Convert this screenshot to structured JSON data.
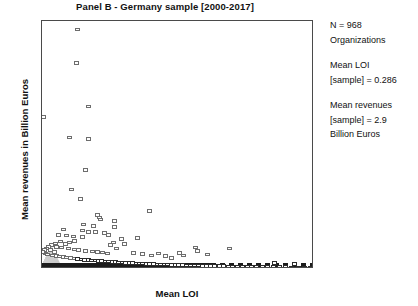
{
  "chart_data": {
    "type": "scatter",
    "title": "Panel B - Germany sample [2000-2017]",
    "xlabel": "Mean LOI",
    "ylabel": "Mean revenues in Billion Euros",
    "xlim": [
      0.0,
      1.0
    ],
    "ylim": [
      0,
      145
    ],
    "xticks": [
      "0.0",
      "0.1",
      "0.2",
      "0.3",
      "0.4",
      "0.5",
      "0.6",
      "0.7",
      "0.8",
      "0.9",
      "1.0"
    ],
    "xtick_values": [
      0.0,
      0.1,
      0.2,
      0.3,
      0.4,
      0.5,
      0.6,
      0.7,
      0.8,
      0.9,
      1.0
    ],
    "yticks": [
      "0",
      "20",
      "40",
      "60",
      "80",
      "100",
      "120",
      "140"
    ],
    "ytick_values": [
      0,
      20,
      40,
      60,
      80,
      100,
      120,
      140
    ],
    "grid": false,
    "legend": null,
    "marker": "open-square",
    "marker_color": "#6d6d6d",
    "points": [
      [
        0.13,
        140.0
      ],
      [
        0.128,
        120.5
      ],
      [
        0.172,
        95.0
      ],
      [
        0.005,
        89.0
      ],
      [
        0.1,
        77.0
      ],
      [
        0.172,
        76.0
      ],
      [
        0.16,
        58.0
      ],
      [
        0.108,
        46.5
      ],
      [
        0.395,
        34.0
      ],
      [
        0.14,
        41.0
      ],
      [
        0.205,
        31.5
      ],
      [
        0.21,
        30.0
      ],
      [
        0.215,
        29.0
      ],
      [
        0.268,
        28.0
      ],
      [
        0.265,
        24.5
      ],
      [
        0.08,
        23.0
      ],
      [
        0.15,
        22.5
      ],
      [
        0.195,
        21.5
      ],
      [
        0.06,
        20.0
      ],
      [
        0.09,
        19.5
      ],
      [
        0.115,
        19.0
      ],
      [
        0.15,
        18.8
      ],
      [
        0.35,
        18.0
      ],
      [
        0.172,
        21.5
      ],
      [
        0.228,
        21.0
      ],
      [
        0.25,
        14.0
      ],
      [
        0.262,
        15.5
      ],
      [
        0.275,
        12.0
      ],
      [
        0.055,
        13.0
      ],
      [
        0.07,
        12.5
      ],
      [
        0.098,
        12.0
      ],
      [
        0.12,
        11.5
      ],
      [
        0.135,
        11.0
      ],
      [
        0.16,
        10.5
      ],
      [
        0.185,
        10.2
      ],
      [
        0.205,
        10.0
      ],
      [
        0.222,
        9.6
      ],
      [
        0.24,
        9.2
      ],
      [
        0.03,
        11.0
      ],
      [
        0.045,
        10.0
      ],
      [
        0.012,
        9.0
      ],
      [
        0.022,
        8.5
      ],
      [
        0.038,
        8.0
      ],
      [
        0.052,
        7.6
      ],
      [
        0.065,
        7.2
      ],
      [
        0.078,
        6.9
      ],
      [
        0.09,
        6.6
      ],
      [
        0.105,
        6.3
      ],
      [
        0.118,
        6.0
      ],
      [
        0.132,
        5.8
      ],
      [
        0.146,
        5.6
      ],
      [
        0.158,
        5.4
      ],
      [
        0.17,
        5.2
      ],
      [
        0.182,
        5.0
      ],
      [
        0.195,
        4.9
      ],
      [
        0.208,
        4.7
      ],
      [
        0.22,
        4.6
      ],
      [
        0.232,
        4.4
      ],
      [
        0.245,
        4.3
      ],
      [
        0.258,
        4.1
      ],
      [
        0.27,
        4.0
      ],
      [
        0.282,
        3.9
      ],
      [
        0.295,
        3.8
      ],
      [
        0.308,
        3.6
      ],
      [
        0.32,
        3.5
      ],
      [
        0.333,
        3.4
      ],
      [
        0.346,
        3.3
      ],
      [
        0.358,
        3.2
      ],
      [
        0.37,
        3.1
      ],
      [
        0.384,
        3.0
      ],
      [
        0.396,
        2.9
      ],
      [
        0.41,
        2.8
      ],
      [
        0.424,
        2.7
      ],
      [
        0.437,
        2.6
      ],
      [
        0.45,
        2.6
      ],
      [
        0.463,
        2.5
      ],
      [
        0.476,
        2.4
      ],
      [
        0.49,
        2.3
      ],
      [
        0.503,
        2.3
      ],
      [
        0.516,
        2.2
      ],
      [
        0.53,
        2.1
      ],
      [
        0.545,
        2.1
      ],
      [
        0.56,
        2.0
      ],
      [
        0.575,
        2.0
      ],
      [
        0.59,
        1.9
      ],
      [
        0.605,
        1.9
      ],
      [
        0.62,
        1.8
      ],
      [
        0.636,
        1.8
      ],
      [
        0.652,
        1.7
      ],
      [
        0.668,
        1.7
      ],
      [
        0.684,
        1.6
      ],
      [
        0.7,
        1.6
      ],
      [
        0.718,
        1.5
      ],
      [
        0.736,
        1.5
      ],
      [
        0.754,
        1.4
      ],
      [
        0.772,
        1.4
      ],
      [
        0.79,
        1.3
      ],
      [
        0.81,
        1.3
      ],
      [
        0.83,
        1.2
      ],
      [
        0.85,
        1.2
      ],
      [
        0.872,
        1.1
      ],
      [
        0.895,
        1.1
      ],
      [
        0.918,
        1.0
      ],
      [
        0.942,
        1.0
      ],
      [
        0.966,
        0.9
      ],
      [
        0.988,
        0.9
      ],
      [
        0.505,
        9.5
      ],
      [
        0.52,
        8.0
      ],
      [
        0.565,
        12.5
      ],
      [
        0.572,
        10.5
      ],
      [
        0.61,
        8.5
      ],
      [
        0.69,
        12.0
      ],
      [
        0.455,
        7.5
      ],
      [
        0.43,
        9.0
      ],
      [
        0.475,
        6.5
      ],
      [
        0.855,
        3.5
      ],
      [
        0.93,
        2.8
      ],
      [
        0.152,
        26.0
      ],
      [
        0.188,
        25.0
      ],
      [
        0.245,
        20.0
      ],
      [
        0.292,
        17.5
      ],
      [
        0.305,
        14.5
      ],
      [
        0.338,
        9.5
      ],
      [
        0.368,
        8.8
      ],
      [
        0.402,
        7.8
      ],
      [
        0.118,
        16.5
      ],
      [
        0.102,
        15.5
      ],
      [
        0.085,
        14.5
      ],
      [
        0.068,
        16.0
      ],
      [
        0.048,
        15.0
      ],
      [
        0.035,
        14.0
      ],
      [
        0.025,
        13.0
      ],
      [
        0.015,
        12.0
      ],
      [
        0.008,
        11.0
      ],
      [
        0.002,
        10.0
      ]
    ]
  },
  "annotations": {
    "block_n": {
      "line1": "N = 968",
      "line2": "Organizations"
    },
    "block_loi": {
      "line1": "Mean LOI",
      "line2": "[sample] = 0.286"
    },
    "block_rev": {
      "line1": "Mean revenues",
      "line2": "[sample] = 2.9",
      "line3": "Billion Euros"
    }
  }
}
